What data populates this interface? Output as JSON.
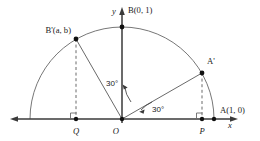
{
  "figure": {
    "axes": {
      "x_label": "x",
      "y_label": "y"
    },
    "points": [
      {
        "key": "A",
        "label": "A(1, 0)",
        "x": 1.0,
        "y": 0.0
      },
      {
        "key": "B",
        "label": "B(0, 1)",
        "x": 0.0,
        "y": 1.0
      },
      {
        "key": "Aprime",
        "label": "A'",
        "x": 0.866,
        "y": 0.5
      },
      {
        "key": "Bprime",
        "label": "B'(a, b)",
        "x": -0.5,
        "y": 0.866
      },
      {
        "key": "O",
        "label": "O",
        "x": 0.0,
        "y": 0.0
      },
      {
        "key": "P",
        "label": "P",
        "x": 0.866,
        "y": 0.0
      },
      {
        "key": "Q",
        "label": "Q",
        "x": -0.5,
        "y": 0.0
      }
    ],
    "angles": [
      {
        "key": "angle-AOAprime",
        "label": "30°",
        "value": 30,
        "from": "A",
        "to": "A'"
      },
      {
        "key": "angle-BOBprime",
        "label": "30°",
        "value": 30,
        "from": "B",
        "to": "B'"
      }
    ],
    "colors": {
      "axis": "#3a3a3a",
      "arc": "#777777",
      "ray": "#6a6a6a",
      "dashed": "#6a6a6a",
      "point": "#111111",
      "text": "#1a1a1a",
      "background": "#ffffff"
    }
  }
}
